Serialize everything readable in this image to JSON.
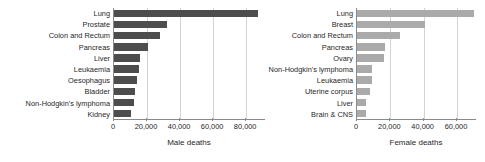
{
  "chart_data": [
    {
      "type": "bar",
      "orientation": "horizontal",
      "title": "",
      "xlabel": "Male deaths",
      "ylabel": "",
      "xlim": [
        0,
        92000
      ],
      "xticks": [
        0,
        20000,
        40000,
        60000,
        80000
      ],
      "xticklabels": [
        "0",
        "20,000",
        "40,000",
        "60,000",
        "80,000"
      ],
      "grid": "vertical",
      "bar_color": "#4d4d4d",
      "legend": "none",
      "categories": [
        "Lung",
        "Prostate",
        "Colon and Rectum",
        "Pancreas",
        "Liver",
        "Leukaemia",
        "Oesophagus",
        "Bladder",
        "Non-Hodgkin's lymphoma",
        "Kidney"
      ],
      "values": [
        87000,
        32000,
        28000,
        20500,
        15500,
        15000,
        14000,
        12500,
        12000,
        10000
      ]
    },
    {
      "type": "bar",
      "orientation": "horizontal",
      "title": "",
      "xlabel": "Female deaths",
      "ylabel": "",
      "xlim": [
        0,
        72000
      ],
      "xticks": [
        0,
        20000,
        40000,
        60000
      ],
      "xticklabels": [
        "0",
        "20,000",
        "40,000",
        "60,000"
      ],
      "grid": "vertical",
      "bar_color": "#aaaaaa",
      "legend": "none",
      "categories": [
        "Lung",
        "Breast",
        "Colon and Rectum",
        "Pancreas",
        "Ovary",
        "Non-Hodgkin's lymphoma",
        "Leukaemia",
        "Uterine corpus",
        "Liver",
        "Brain & CNS"
      ],
      "values": [
        70000,
        41000,
        26000,
        17000,
        16000,
        9000,
        9000,
        7500,
        5500,
        5500
      ]
    }
  ]
}
